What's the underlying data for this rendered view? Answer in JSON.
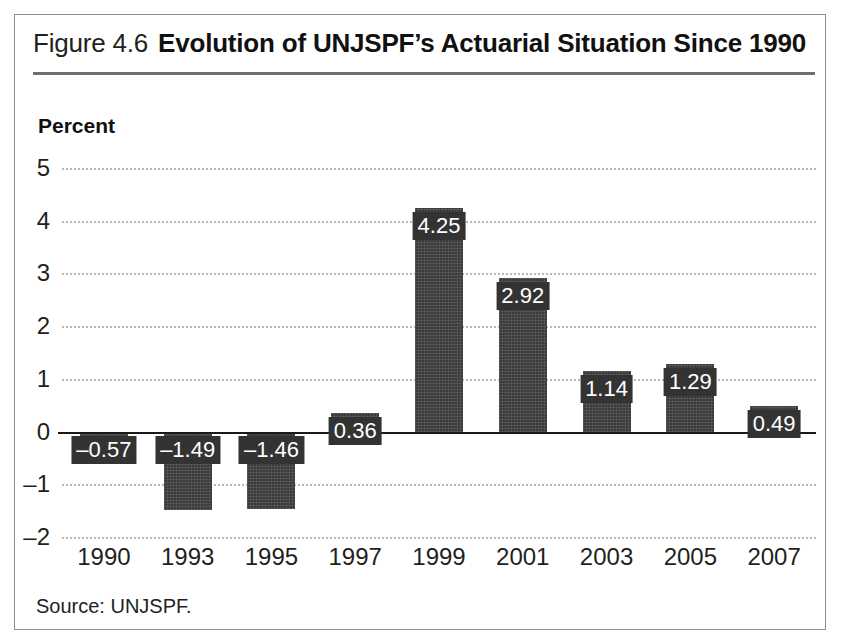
{
  "figure": {
    "number_label": "Figure 4.6",
    "title": "Evolution of UNJSPF’s Actuarial Situation Since 1990",
    "source_note": "Source: UNJSPF."
  },
  "chart_data": {
    "type": "bar",
    "title": "Evolution of UNJSPF’s Actuarial Situation Since 1990",
    "subtitle": "",
    "xlabel": "",
    "ylabel": "Percent",
    "categories": [
      "1990",
      "1993",
      "1995",
      "1997",
      "1999",
      "2001",
      "2003",
      "2005",
      "2007"
    ],
    "values": [
      -0.57,
      -1.49,
      -1.46,
      0.36,
      4.25,
      2.92,
      1.14,
      1.29,
      0.49
    ],
    "value_labels": [
      "–0.57",
      "–1.49",
      "–1.46",
      "0.36",
      "4.25",
      "2.92",
      "1.14",
      "1.29",
      "0.49"
    ],
    "ylim": [
      -2,
      5
    ],
    "yticks": [
      5,
      4,
      3,
      2,
      1,
      0,
      -1,
      -2
    ],
    "ytick_labels": [
      "5",
      "4",
      "3",
      "2",
      "1",
      "0",
      "–1",
      "–2"
    ],
    "grid": true,
    "grid_style": "dotted-horizontal",
    "legend": null,
    "bar_color": "#3a3a3a",
    "label_box_color": "#333333",
    "label_text_color": "#ffffff",
    "axis_text_color": "#231f20",
    "zero_line_color": "#1a1a1a",
    "grid_color": "#b7b7b7"
  }
}
